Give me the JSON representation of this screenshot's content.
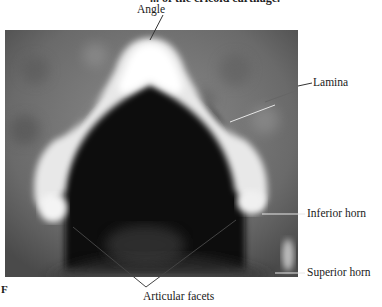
{
  "figure": {
    "caption_fragment": "... of the cricoid cartilage.",
    "panel_letter": "F",
    "photo_description": "Photograph of cartilage ring viewed from above on mottled gray background",
    "labels": {
      "angle": "Angle",
      "lamina": "Lamina",
      "inferior_horn": "Inferior horn",
      "superior_horn": "Superior horn",
      "articular_facets": "Articular facets"
    }
  }
}
